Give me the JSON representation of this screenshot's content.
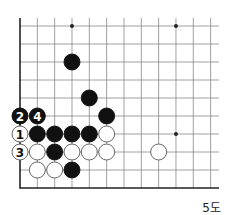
{
  "diagram": {
    "caption": "5도",
    "grid": {
      "cols": 12,
      "rows": 10,
      "origin_x": 20,
      "origin_y": 26,
      "step_x": 17.33,
      "step_y": 18,
      "extend_right": 219,
      "edges": [
        "left",
        "bottom"
      ]
    },
    "star_points": [
      [
        3,
        0
      ],
      [
        9,
        0
      ],
      [
        9,
        6
      ]
    ],
    "stones": [
      {
        "color": "black",
        "col": 3,
        "row": 2
      },
      {
        "color": "black",
        "col": 4,
        "row": 4
      },
      {
        "color": "black",
        "col": 5,
        "row": 5
      },
      {
        "color": "black",
        "col": 0,
        "row": 5,
        "label": "2"
      },
      {
        "color": "black",
        "col": 1,
        "row": 5,
        "label": "4"
      },
      {
        "color": "white",
        "col": 0,
        "row": 6,
        "label": "1"
      },
      {
        "color": "black",
        "col": 1,
        "row": 6
      },
      {
        "color": "black",
        "col": 2,
        "row": 6
      },
      {
        "color": "black",
        "col": 3,
        "row": 6
      },
      {
        "color": "black",
        "col": 4,
        "row": 6
      },
      {
        "color": "white",
        "col": 5,
        "row": 6
      },
      {
        "color": "white",
        "col": 0,
        "row": 7,
        "label": "3"
      },
      {
        "color": "white",
        "col": 1,
        "row": 7
      },
      {
        "color": "black",
        "col": 2,
        "row": 7
      },
      {
        "color": "white",
        "col": 3,
        "row": 7
      },
      {
        "color": "white",
        "col": 4,
        "row": 7
      },
      {
        "color": "white",
        "col": 5,
        "row": 7
      },
      {
        "color": "white",
        "col": 8,
        "row": 7
      },
      {
        "color": "white",
        "col": 1,
        "row": 8
      },
      {
        "color": "white",
        "col": 2,
        "row": 8
      },
      {
        "color": "black",
        "col": 3,
        "row": 8
      }
    ],
    "colors": {
      "line": "#888888",
      "edge": "#222222",
      "black": "#111111",
      "white": "#ffffff"
    }
  }
}
